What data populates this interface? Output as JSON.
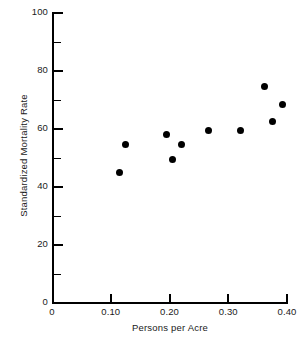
{
  "chart_data": {
    "type": "scatter",
    "title": "",
    "xlabel": "Persons per Acre",
    "ylabel": "Standardized Mortality Rate",
    "xlim": [
      0,
      0.4
    ],
    "ylim": [
      0,
      100
    ],
    "grid": false,
    "legend": null,
    "x_ticks_major": [
      "0",
      "0.10",
      "0.20",
      "0.30",
      "0.40"
    ],
    "x_tick_values": [
      0,
      0.1,
      0.2,
      0.3,
      0.4
    ],
    "y_ticks_major": [
      "0",
      "20",
      "40",
      "60",
      "80",
      "100"
    ],
    "y_tick_values": [
      0,
      20,
      40,
      60,
      80,
      100
    ],
    "y_ticks_minor": [
      10,
      30,
      50,
      70,
      90
    ],
    "points": [
      {
        "x": 0.115,
        "y": 45.0
      },
      {
        "x": 0.125,
        "y": 54.5
      },
      {
        "x": 0.195,
        "y": 58.0
      },
      {
        "x": 0.205,
        "y": 49.5
      },
      {
        "x": 0.22,
        "y": 54.5
      },
      {
        "x": 0.267,
        "y": 59.5
      },
      {
        "x": 0.32,
        "y": 59.5
      },
      {
        "x": 0.362,
        "y": 74.5
      },
      {
        "x": 0.375,
        "y": 62.5
      },
      {
        "x": 0.393,
        "y": 68.5
      }
    ],
    "marker": {
      "shape": "circle",
      "color": "#000000",
      "size_px": 7
    },
    "axis_color": "#000000",
    "background": "#ffffff"
  }
}
